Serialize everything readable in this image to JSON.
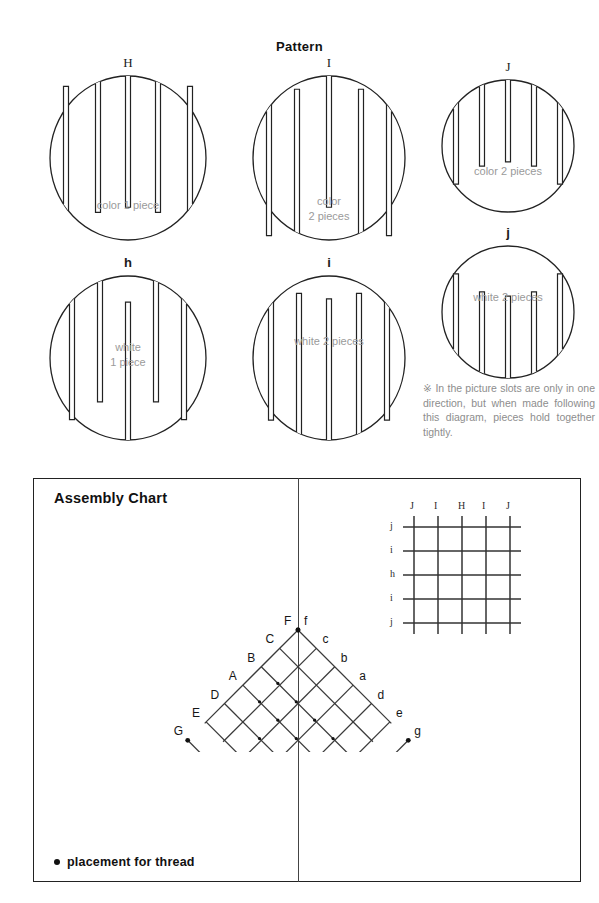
{
  "pattern": {
    "title": "Pattern",
    "pieces": [
      {
        "id": "H",
        "label": "H",
        "caption": "color 1 piece",
        "caption_lines": [
          "color 1 piece"
        ],
        "cx": 128,
        "cy": 158,
        "rx": 78,
        "ry": 82,
        "label_case": "upper",
        "top_slots": [
          -30,
          0,
          30
        ],
        "bottom_slots": [
          -62,
          62
        ],
        "slot_depth_top": 0.8,
        "slot_depth_bottom": 0.76,
        "caption_y": 40
      },
      {
        "id": "I",
        "label": "I",
        "caption": "color 2 pieces",
        "caption_lines": [
          "color",
          "2 pieces"
        ],
        "cx": 329,
        "cy": 158,
        "rx": 76,
        "ry": 82,
        "label_case": "upper",
        "top_slots": [
          -60,
          0,
          60
        ],
        "bottom_slots": [
          -32,
          32
        ],
        "slot_depth_top": 0.8,
        "slot_depth_bottom": 0.88,
        "caption_y": 36
      },
      {
        "id": "J",
        "label": "J",
        "caption": "color 2 pieces",
        "caption_lines": [
          "color 2 pieces"
        ],
        "cx": 508,
        "cy": 146,
        "rx": 66,
        "ry": 66,
        "label_case": "upper",
        "top_slots": [
          -52,
          -26,
          0,
          26,
          52
        ],
        "bottom_slots": [],
        "slot_depth_top": 0.62,
        "slot_depth_bottom": 0,
        "caption_y": 18
      },
      {
        "id": "h",
        "label": "h",
        "caption": "white 1 piece",
        "caption_lines": [
          "white",
          "1 piece"
        ],
        "cx": 128,
        "cy": 358,
        "rx": 78,
        "ry": 82,
        "label_case": "lower",
        "top_slots": [
          -56,
          -28,
          28,
          56
        ],
        "bottom_slots": [
          0
        ],
        "slot_depth_top": 0.74,
        "slot_depth_bottom": 0.84,
        "caption_y": -18
      },
      {
        "id": "i",
        "label": "i",
        "caption": "white 2 pieces",
        "caption_lines": [
          "white 2 pieces"
        ],
        "cx": 329,
        "cy": 358,
        "rx": 76,
        "ry": 82,
        "label_case": "lower",
        "top_slots": [
          -58,
          58
        ],
        "bottom_slots": [
          -30,
          0,
          30
        ],
        "slot_depth_top": 0.72,
        "slot_depth_bottom": 0.86,
        "caption_y": -24
      },
      {
        "id": "j",
        "label": "j",
        "caption": "white 2 pieces",
        "caption_lines": [
          "white 2 pieces"
        ],
        "cx": 508,
        "cy": 312,
        "rx": 66,
        "ry": 66,
        "label_case": "lower",
        "top_slots": [],
        "bottom_slots": [
          -52,
          -26,
          0,
          26,
          52
        ],
        "slot_depth_top": 0,
        "slot_depth_bottom": 0.62,
        "caption_y": -22
      }
    ],
    "note": "※ In the picture slots are only in one direction, but when made following this diagram, pieces hold together tightly."
  },
  "assembly": {
    "title": "Assembly Chart",
    "legend": "placement for thread",
    "grid": {
      "top_labels": [
        "J",
        "I",
        "H",
        "I",
        "J"
      ],
      "left_labels": [
        "j",
        "i",
        "h",
        "i",
        "j"
      ],
      "columns": 5,
      "rows": 5,
      "spacing": 24
    },
    "lattice": {
      "left_labels": [
        "G",
        "E",
        "D",
        "A",
        "B",
        "C",
        "F"
      ],
      "right_labels": [
        "f",
        "c",
        "b",
        "a",
        "d",
        "e",
        "g"
      ],
      "thread_points": [
        "F",
        "f",
        "G",
        "g"
      ],
      "rows": 4,
      "cell": 26
    }
  },
  "colors": {
    "ink": "#222222",
    "caption_gray": "#9a9a9a",
    "note_gray": "#8d8d8d",
    "lattice": "#3a3a3a"
  }
}
